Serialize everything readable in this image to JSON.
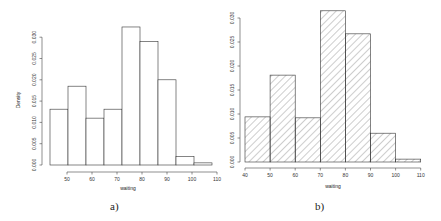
{
  "figure": {
    "panels": [
      "a)",
      "b)"
    ]
  },
  "chart_data": [
    {
      "type": "bar",
      "panel": "a)",
      "style": "outline",
      "title": "",
      "xlabel": "waiting",
      "ylabel": "Density",
      "xlim": [
        43,
        110
      ],
      "ylim": [
        0,
        0.03
      ],
      "x_ticks": [
        50,
        60,
        70,
        80,
        90,
        100,
        110
      ],
      "y_ticks": [
        "0.000",
        "0.005",
        "0.010",
        "0.015",
        "0.020",
        "0.025",
        "0.030"
      ],
      "bin_edges": [
        43.2,
        50.4,
        57.6,
        64.8,
        72.0,
        79.2,
        86.4,
        93.6,
        100.8,
        108.0
      ],
      "values": [
        0.0131,
        0.0185,
        0.011,
        0.0131,
        0.0324,
        0.029,
        0.02,
        0.002,
        0.0005
      ],
      "grid": false,
      "legend": null
    },
    {
      "type": "bar",
      "panel": "b)",
      "style": "hatched",
      "title": "",
      "xlabel": "waiting",
      "ylabel": "",
      "xlim": [
        40,
        110
      ],
      "ylim": [
        0,
        0.03
      ],
      "x_ticks": [
        40,
        50,
        60,
        70,
        80,
        90,
        100,
        110
      ],
      "y_ticks": [
        "0.000",
        "0.005",
        "0.010",
        "0.015",
        "0.020",
        "0.025",
        "0.030"
      ],
      "bin_edges": [
        40,
        50,
        60,
        70,
        80,
        90,
        100,
        110
      ],
      "values": [
        0.0094,
        0.0181,
        0.0092,
        0.0315,
        0.0267,
        0.006,
        0.0006
      ],
      "grid": false,
      "legend": null
    }
  ],
  "layout": {
    "a": {
      "x0px": 67,
      "x0val": 50,
      "pxPerUnit": 2.5,
      "y0px": 165,
      "pxPerDensity": 4260,
      "yaxis_x": 42,
      "xaxis_y": 172,
      "xlabel_x": 128,
      "xlabel_y": 190,
      "ylabel_x": 20,
      "ylabel_y": 100,
      "panel_x": 110,
      "panel_y": 210
    },
    "b": {
      "x0px": 245,
      "x0val": 40,
      "pxPerUnit": 2.51,
      "y0px": 162,
      "pxPerDensity": 4800,
      "yaxis_x": 240,
      "xaxis_y": 168,
      "xlabel_x": 333,
      "xlabel_y": 188,
      "ylabel_x": 0,
      "ylabel_y": 0,
      "panel_x": 315,
      "panel_y": 210
    }
  },
  "colors": {
    "bar_stroke": "#333333",
    "bar_fill": "#ffffff",
    "hatch": "#555555",
    "axis": "#444444"
  }
}
